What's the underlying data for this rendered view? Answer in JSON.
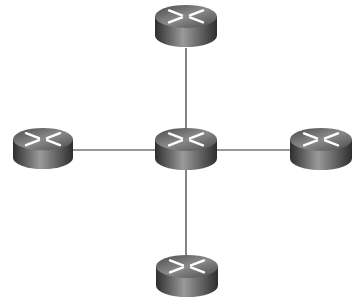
{
  "diagram": {
    "type": "star-topology",
    "background": "#ffffff",
    "link_color": "#333333",
    "router_colors": {
      "top_light": "#8a8a8a",
      "top_dark": "#4a4a4a",
      "side_light": "#9a9a9a",
      "side_dark": "#2e2e2e",
      "arrow": "#ffffff"
    },
    "nodes": [
      {
        "id": "top",
        "icon": "router-icon",
        "x": 154,
        "y": 4,
        "w": 64,
        "h": 44
      },
      {
        "id": "left",
        "icon": "router-icon",
        "x": 12,
        "y": 127,
        "w": 62,
        "h": 43
      },
      {
        "id": "center",
        "icon": "router-icon",
        "x": 154,
        "y": 127,
        "w": 64,
        "h": 44
      },
      {
        "id": "right",
        "icon": "router-icon",
        "x": 289,
        "y": 127,
        "w": 64,
        "h": 44
      },
      {
        "id": "bottom",
        "icon": "router-icon",
        "x": 155,
        "y": 254,
        "w": 64,
        "h": 44
      }
    ],
    "links": [
      {
        "from": "center",
        "to": "top"
      },
      {
        "from": "center",
        "to": "left"
      },
      {
        "from": "center",
        "to": "right"
      },
      {
        "from": "center",
        "to": "bottom"
      }
    ]
  }
}
